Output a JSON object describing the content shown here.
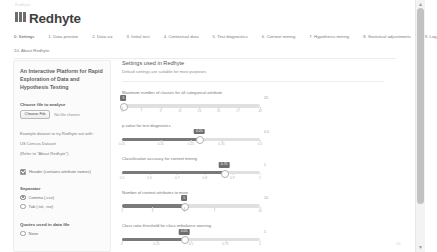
{
  "browser": {
    "pre_title": "Redhyte",
    "scroll_up_icon": "▲",
    "scroll_down_icon": "▼",
    "foot_note": "1/2"
  },
  "header": {
    "logo_icon": "redhyte-logo-icon",
    "title": "Redhyte"
  },
  "tabs": {
    "row1": [
      {
        "label": "0. Settings",
        "active": true
      },
      {
        "label": "1. Data preview",
        "active": false
      },
      {
        "label": "2. Data viz",
        "active": false
      },
      {
        "label": "3. Initial test",
        "active": false
      },
      {
        "label": "4. Contextual data",
        "active": false
      },
      {
        "label": "5. Test diagnostics",
        "active": false
      },
      {
        "label": "6. Context mining",
        "active": false
      },
      {
        "label": "7. Hypothesis mining",
        "active": false
      },
      {
        "label": "8. Statistical adjustments",
        "active": false
      },
      {
        "label": "9. Log",
        "active": false
      }
    ],
    "row2": [
      {
        "label": "10. About Redhyte",
        "active": false
      }
    ]
  },
  "sidebar": {
    "heading": "An Interactive Platform for Rapid Exploration of Data and Hypothesis Testing",
    "file_label": "Choose file to analyse",
    "file_button": "Choose File",
    "file_status": "No file chosen",
    "example_note_1": "Example dataset to try Redhyte out with:",
    "example_note_2": "US Census Dataset",
    "example_note_3": "(Refer to \"About Redhyte\")",
    "header_checkbox": {
      "label": "Header (contains attribute names)",
      "checked": true,
      "icon": "check-icon"
    },
    "separator_title": "Separator",
    "separator_options": [
      {
        "label": "Comma (.csv)",
        "selected": true
      },
      {
        "label": "Tab (.txt, .tsv)",
        "selected": false
      }
    ],
    "quotes_title": "Quotes used in data file",
    "quotes_options": [
      {
        "label": "None",
        "selected": false
      }
    ]
  },
  "main": {
    "title": "Settings used in Redhyte",
    "subtitle": "Default settings are suitable for most purposes",
    "sliders": [
      {
        "label": "Maximum number of classes for all categorical attribute",
        "value": "5",
        "max_label": "20",
        "percent": 1,
        "ticks": [
          {
            "label": "5",
            "pos": 0
          },
          {
            "label": "7",
            "pos": 14
          },
          {
            "label": "9",
            "pos": 28
          },
          {
            "label": "11",
            "pos": 42
          },
          {
            "label": "13",
            "pos": 56
          },
          {
            "label": "15",
            "pos": 70
          },
          {
            "label": "17",
            "pos": 84
          },
          {
            "label": "20",
            "pos": 100
          }
        ]
      },
      {
        "label": "p-value for test diagnostics",
        "value": "0.05",
        "max_label": "0.5",
        "percent": 56,
        "ticks": [
          {
            "label": "0.01",
            "pos": 0
          },
          {
            "label": "0.15",
            "pos": 28
          },
          {
            "label": "0.25",
            "pos": 50
          },
          {
            "label": "0.35",
            "pos": 72
          },
          {
            "label": "0.5",
            "pos": 100
          }
        ]
      },
      {
        "label": "Classification accuracy for context mining",
        "value": "0.75",
        "max_label": "1",
        "percent": 74,
        "ticks": [
          {
            "label": "0.5",
            "pos": 0
          },
          {
            "label": "0.6",
            "pos": 20
          },
          {
            "label": "0.7",
            "pos": 40
          },
          {
            "label": "0.8",
            "pos": 60
          },
          {
            "label": "0.9",
            "pos": 80
          },
          {
            "label": "1",
            "pos": 100
          }
        ]
      },
      {
        "label": "Number of context attributes to mine",
        "value": "5",
        "max_label": "10",
        "percent": 45,
        "ticks": [
          {
            "label": "1",
            "pos": 0
          },
          {
            "label": "3",
            "pos": 22
          },
          {
            "label": "5",
            "pos": 45
          },
          {
            "label": "7",
            "pos": 67
          },
          {
            "label": "10",
            "pos": 100
          }
        ]
      },
      {
        "label": "Class ratio threshold for class imbalance warning",
        "value": "0.05",
        "max_label": "1",
        "percent": 45,
        "ticks": [
          {
            "label": "0",
            "pos": 0
          },
          {
            "label": "0.25",
            "pos": 25
          },
          {
            "label": "0.5",
            "pos": 50
          },
          {
            "label": "0.75",
            "pos": 75
          },
          {
            "label": "1",
            "pos": 100
          }
        ]
      }
    ]
  }
}
